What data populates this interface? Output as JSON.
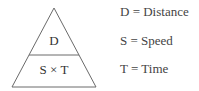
{
  "triangle": {
    "top_label": "D",
    "bottom_label": "S × T"
  },
  "legend": [
    {
      "text": "D = Distance"
    },
    {
      "text": "S = Speed"
    },
    {
      "text": "T = Time"
    }
  ],
  "colors": {
    "stroke": "#555555",
    "text": "#3a3a3a"
  }
}
